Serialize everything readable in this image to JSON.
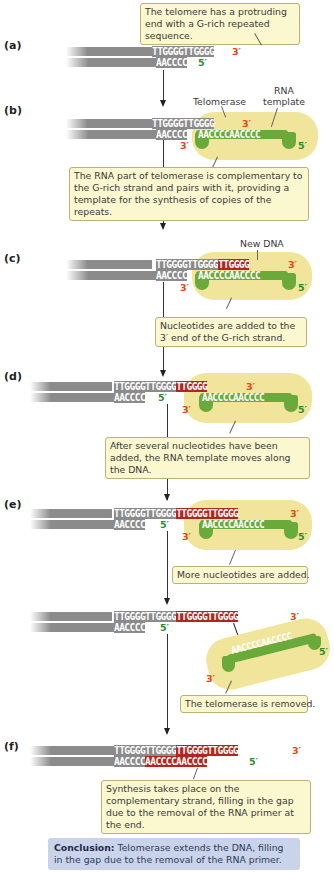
{
  "panels": {
    "a": {
      "label": "(a)",
      "callout": "The telomere has a protruding end with a G-rich repeated sequence.",
      "top_strand": "TTGGGGTTGGGG",
      "bottom_strand": "AACCCC",
      "top_end": "3′",
      "bottom_end": "5′"
    },
    "b": {
      "label": "(b)",
      "telomerase_label": "Telomerase",
      "rna_template_label": "RNA template",
      "top_strand": "TTGGGGTTGGGG",
      "bottom_strand": "AACCCC",
      "rna_seq": "AACCCCAACCCC",
      "top_end": "3′",
      "rna_3": "3′",
      "rna_5": "5′",
      "callout": "The RNA part of telomerase is complementary to the G-rich strand and pairs with it, providing a template for the synthesis of copies of the repeats."
    },
    "c": {
      "label": "(c)",
      "new_dna_label": "New DNA",
      "top_strand_old": "TTGGGGTTGGGG",
      "top_strand_new": "TTGGGG",
      "bottom_strand": "AACCCC",
      "rna_seq": "AACCCCAACCCC",
      "top_end": "3′",
      "rna_3": "3′",
      "rna_5": "5′",
      "callout": "Nucleotides are added to the 3′ end of the G-rich strand."
    },
    "d": {
      "label": "(d)",
      "top_strand_old": "TTGGGGTTGGGG",
      "top_strand_new": "TTGGGG",
      "bottom_strand": "AACCCC",
      "bottom_end": "5′",
      "rna_seq": "AACCCCAACCCC",
      "top_end": "3′",
      "rna_3": "3′",
      "rna_5": "5′",
      "callout": "After several nucleotides have been added, the RNA template moves along the DNA."
    },
    "e": {
      "label": "(e)",
      "top_strand_old": "TTGGGGTTGGGG",
      "top_strand_new": "TTGGGGTTGGGG",
      "bottom_strand": "AACCCC",
      "bottom_end": "5′",
      "rna_seq": "AACCCCAACCCC",
      "top_end": "3′",
      "rna_3": "3′",
      "rna_5": "5′",
      "callout": "More nucleotides are added."
    },
    "removed": {
      "top_strand_old": "TTGGGGTTGGGG",
      "top_strand_new": "TTGGGGTTGGGG",
      "bottom_strand": "AACCCC",
      "bottom_end": "5′",
      "top_end": "3′",
      "rna_seq": "AACCCCAACCCC",
      "rna_3": "3′",
      "rna_5": "5′",
      "callout": "The telomerase is removed."
    },
    "f": {
      "label": "(f)",
      "top_strand_old": "TTGGGGTTGGGG",
      "top_strand_new": "TTGGGGTTGGGG",
      "bottom_strand_old": "AACCCC",
      "bottom_strand_new": "AACCCCAACCCC",
      "top_end": "3′",
      "bottom_end": "5′",
      "callout": "Synthesis takes place on the complementary strand, filling in the gap due to the removal of the RNA primer at the end."
    }
  },
  "conclusion": {
    "title": "Conclusion:",
    "text": " Telomerase extends the DNA, filling in the gap due to the removal of the RNA primer."
  },
  "colors": {
    "dna_gray": "#8b8b8b",
    "new_dna_red": "#b5251d",
    "three_prime": "#e04a1a",
    "five_prime": "#2e8b2e",
    "telomerase_yellow": "#f0e59a",
    "rna_green": "#6aaa3a",
    "callout_bg": "#fbf7cf",
    "conclusion_bg": "#c9d3ea"
  }
}
